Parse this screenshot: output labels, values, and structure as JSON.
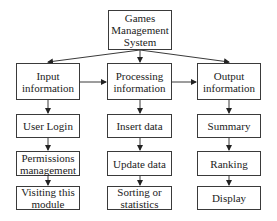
{
  "diagram": {
    "root": {
      "id": "root",
      "label": "Games Management System"
    },
    "columns": [
      {
        "id": "input",
        "label": "Input information",
        "children": [
          "User Login",
          "Permissions management",
          "Visiting this module"
        ]
      },
      {
        "id": "processing",
        "label": "Processing information",
        "children": [
          "Insert data",
          "Update data",
          "Sorting or statistics"
        ]
      },
      {
        "id": "output",
        "label": "Output information",
        "children": [
          "Summary",
          "Ranking",
          "Display"
        ]
      }
    ],
    "lines": {
      "root": [
        "Games",
        "Management",
        "System"
      ],
      "input": [
        "Input",
        "information"
      ],
      "processing": [
        "Processing",
        "information"
      ],
      "output": [
        "Output",
        "information"
      ],
      "input_children": [
        [
          "User Login"
        ],
        [
          "Permissions",
          "management"
        ],
        [
          "Visiting this",
          "module"
        ]
      ],
      "processing_children": [
        [
          "Insert data"
        ],
        [
          "Update data"
        ],
        [
          "Sorting or",
          "statistics"
        ]
      ],
      "output_children": [
        [
          "Summary"
        ],
        [
          "Ranking"
        ],
        [
          "Display"
        ]
      ]
    },
    "edges": [
      {
        "from": "Games Management System",
        "to": "Input information"
      },
      {
        "from": "Games Management System",
        "to": "Processing information"
      },
      {
        "from": "Games Management System",
        "to": "Output information"
      },
      {
        "from": "Input information",
        "to": "Processing information"
      },
      {
        "from": "Processing information",
        "to": "Output information"
      },
      {
        "from": "Input information",
        "to": "User Login"
      },
      {
        "from": "User Login",
        "to": "Permissions management"
      },
      {
        "from": "Permissions management",
        "to": "Visiting this module"
      },
      {
        "from": "Processing information",
        "to": "Insert data"
      },
      {
        "from": "Insert data",
        "to": "Update data"
      },
      {
        "from": "Update data",
        "to": "Sorting or statistics"
      },
      {
        "from": "Output information",
        "to": "Summary"
      },
      {
        "from": "Summary",
        "to": "Ranking"
      },
      {
        "from": "Ranking",
        "to": "Display"
      }
    ],
    "colors": {
      "stroke": "#3a3a3a",
      "fill": "#ffffff",
      "text": "#222222"
    }
  }
}
